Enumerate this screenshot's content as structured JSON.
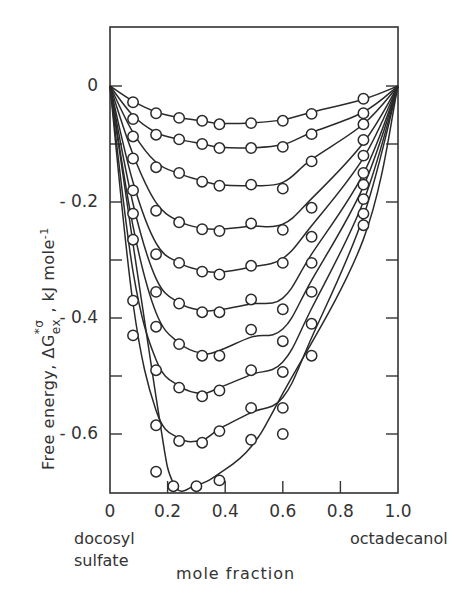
{
  "chart_data": {
    "type": "line",
    "title": "",
    "xlabel": "mole fraction",
    "ylabel": "Free energy, ΔG*σ ex , kJ mole⁻¹",
    "ylabel_parts": {
      "prefix": "Free energy,  ΔG",
      "sup": "*σ",
      "sub": "ex",
      "suffix": " ,  kJ mole",
      "unit_sup": "-1"
    },
    "x_end_labels": {
      "left": [
        "docosyl",
        "sulfate"
      ],
      "right": "octadecanol"
    },
    "xlim": [
      0,
      1.0
    ],
    "ylim": [
      -0.7,
      0.1
    ],
    "x_ticks": [
      0,
      0.2,
      0.4,
      0.6,
      0.8,
      1.0
    ],
    "x_tick_labels": [
      "0",
      "0.2",
      "0.4",
      "0.6",
      "0.8",
      "1.0"
    ],
    "y_ticks": [
      0,
      -0.1,
      -0.2,
      -0.3,
      -0.4,
      -0.5,
      -0.6
    ],
    "y_tick_labels": {
      "0": "0",
      "-0.2": "- 0.2",
      "-0.4": "- 0.4",
      "-0.6": "- 0.6"
    },
    "grid": false,
    "legend": null,
    "marker": "open-circle",
    "series": [
      {
        "name": "curve-1",
        "points": [
          [
            0.08,
            -0.028
          ],
          [
            0.16,
            -0.047
          ],
          [
            0.24,
            -0.055
          ],
          [
            0.32,
            -0.06
          ],
          [
            0.38,
            -0.066
          ],
          [
            0.49,
            -0.064
          ],
          [
            0.6,
            -0.06
          ],
          [
            0.7,
            -0.048
          ],
          [
            0.88,
            -0.022
          ]
        ],
        "fit_min": -0.066
      },
      {
        "name": "curve-2",
        "points": [
          [
            0.08,
            -0.057
          ],
          [
            0.16,
            -0.084
          ],
          [
            0.24,
            -0.092
          ],
          [
            0.32,
            -0.1
          ],
          [
            0.38,
            -0.107
          ],
          [
            0.49,
            -0.107
          ],
          [
            0.6,
            -0.105
          ],
          [
            0.7,
            -0.083
          ],
          [
            0.88,
            -0.047
          ]
        ],
        "fit_min": -0.107
      },
      {
        "name": "curve-3",
        "points": [
          [
            0.08,
            -0.087
          ],
          [
            0.16,
            -0.14
          ],
          [
            0.24,
            -0.15
          ],
          [
            0.32,
            -0.165
          ],
          [
            0.38,
            -0.172
          ],
          [
            0.49,
            -0.17
          ],
          [
            0.6,
            -0.177
          ],
          [
            0.7,
            -0.13
          ],
          [
            0.88,
            -0.066
          ]
        ],
        "fit_min": -0.18
      },
      {
        "name": "curve-4",
        "points": [
          [
            0.08,
            -0.125
          ],
          [
            0.16,
            -0.215
          ],
          [
            0.24,
            -0.235
          ],
          [
            0.32,
            -0.247
          ],
          [
            0.38,
            -0.25
          ],
          [
            0.49,
            -0.237
          ],
          [
            0.6,
            -0.248
          ],
          [
            0.7,
            -0.21
          ],
          [
            0.88,
            -0.093
          ]
        ],
        "fit_min": -0.258
      },
      {
        "name": "curve-5",
        "points": [
          [
            0.08,
            -0.18
          ],
          [
            0.16,
            -0.29
          ],
          [
            0.24,
            -0.305
          ],
          [
            0.32,
            -0.32
          ],
          [
            0.38,
            -0.325
          ],
          [
            0.49,
            -0.31
          ],
          [
            0.6,
            -0.305
          ],
          [
            0.7,
            -0.26
          ],
          [
            0.88,
            -0.12
          ]
        ],
        "fit_min": -0.325
      },
      {
        "name": "curve-6",
        "points": [
          [
            0.08,
            -0.22
          ],
          [
            0.16,
            -0.355
          ],
          [
            0.24,
            -0.375
          ],
          [
            0.32,
            -0.39
          ],
          [
            0.38,
            -0.39
          ],
          [
            0.49,
            -0.368
          ],
          [
            0.6,
            -0.385
          ],
          [
            0.7,
            -0.305
          ],
          [
            0.88,
            -0.15
          ]
        ],
        "fit_min": -0.395
      },
      {
        "name": "curve-7",
        "points": [
          [
            0.08,
            -0.265
          ],
          [
            0.16,
            -0.415
          ],
          [
            0.24,
            -0.445
          ],
          [
            0.32,
            -0.465
          ],
          [
            0.38,
            -0.465
          ],
          [
            0.49,
            -0.42
          ],
          [
            0.6,
            -0.44
          ],
          [
            0.7,
            -0.355
          ],
          [
            0.88,
            -0.17
          ]
        ],
        "fit_min": -0.468
      },
      {
        "name": "curve-8",
        "points": [
          [
            0.08,
            -0.37
          ],
          [
            0.16,
            -0.49
          ],
          [
            0.24,
            -0.52
          ],
          [
            0.32,
            -0.535
          ],
          [
            0.38,
            -0.525
          ],
          [
            0.49,
            -0.49
          ],
          [
            0.6,
            -0.493
          ],
          [
            0.7,
            -0.41
          ],
          [
            0.88,
            -0.195
          ]
        ],
        "fit_min": -0.535
      },
      {
        "name": "curve-9",
        "points": [
          [
            0.08,
            -0.43
          ],
          [
            0.16,
            -0.585
          ],
          [
            0.24,
            -0.612
          ],
          [
            0.32,
            -0.615
          ],
          [
            0.38,
            -0.595
          ],
          [
            0.49,
            -0.555
          ],
          [
            0.6,
            -0.555
          ],
          [
            0.7,
            -0.465
          ],
          [
            0.88,
            -0.22
          ]
        ],
        "fit_min": -0.618
      },
      {
        "name": "curve-10",
        "points": [
          [
            0.16,
            -0.665
          ],
          [
            0.22,
            -0.69
          ],
          [
            0.3,
            -0.69
          ],
          [
            0.38,
            -0.68
          ],
          [
            0.49,
            -0.61
          ],
          [
            0.6,
            -0.6
          ],
          [
            0.88,
            -0.24
          ]
        ],
        "fit_min": -0.695
      }
    ]
  },
  "labels": {
    "xlabel": "mole fraction",
    "left_end_1": "docosyl",
    "left_end_2": "sulfate",
    "right_end": "octadecanol",
    "ylabel_main": "Free energy,  ΔG",
    "ylabel_sup": "*σ",
    "ylabel_sub": "ex",
    "ylabel_unit": " ,  kJ mole",
    "ylabel_unit_sup": "-1"
  }
}
